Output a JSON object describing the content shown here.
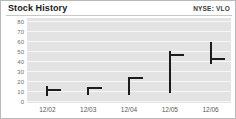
{
  "header": {
    "title": "Stock History",
    "ticker": "NYSE: VLO"
  },
  "chart_data": {
    "type": "bar",
    "title": "Stock History",
    "subtitle": "NYSE: VLO",
    "xlabel": "",
    "ylabel": "",
    "grid": true,
    "legend": "none",
    "categories": [
      "12/02",
      "12/03",
      "12/04",
      "12/05",
      "12/06"
    ],
    "ytick_labels": [
      "80",
      "70",
      "60",
      "50",
      "40",
      "30",
      "20",
      "10",
      "0"
    ],
    "ytick_values": [
      80,
      70,
      60,
      50,
      40,
      30,
      20,
      10,
      0
    ],
    "ylim": [
      0,
      80
    ],
    "series": [
      {
        "name": "high",
        "values": [
          16,
          15,
          25,
          51,
          60
        ]
      },
      {
        "name": "low",
        "values": [
          6,
          7,
          7,
          9,
          38
        ]
      },
      {
        "name": "close",
        "values": [
          13,
          15,
          25,
          48,
          44
        ]
      }
    ],
    "points": [
      {
        "x": "12/02",
        "high": 16,
        "low": 6,
        "close": 13
      },
      {
        "x": "12/03",
        "high": 15,
        "low": 7,
        "close": 15
      },
      {
        "x": "12/04",
        "high": 25,
        "low": 7,
        "close": 25
      },
      {
        "x": "12/05",
        "high": 51,
        "low": 9,
        "close": 48
      },
      {
        "x": "12/06",
        "high": 60,
        "low": 38,
        "close": 44
      }
    ],
    "colors": {
      "plot_background": "#e3e3e3",
      "gridline": "#f7f7f7",
      "bar": "#1c1c1c",
      "axis_text": "#6d6d6d",
      "title_text": "#1a1a1a",
      "panel_border": "#b9b9b9"
    }
  }
}
